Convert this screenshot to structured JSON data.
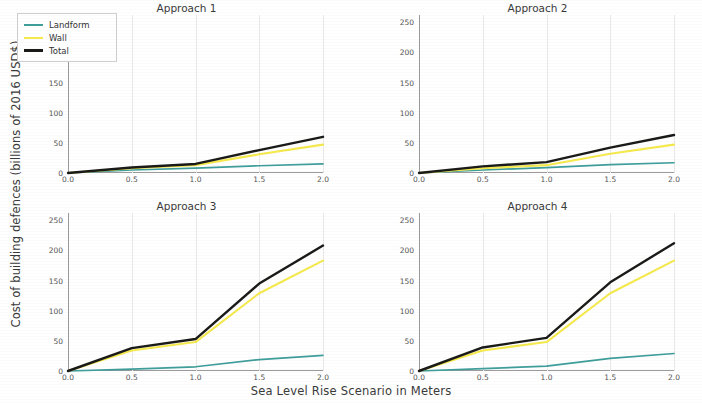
{
  "figure": {
    "ylabel": "Cost of building defences (billions of 2016 USD$)",
    "xlabel": "Sea Level Rise Scenario in Meters"
  },
  "legend": {
    "position": "upper-left-of-panel-1",
    "items": [
      {
        "label": "Landform",
        "color": "#3f9e9b",
        "width": 2.0
      },
      {
        "label": "Wall",
        "color": "#f5e94e",
        "width": 2.6
      },
      {
        "label": "Total",
        "color": "#1a1a18",
        "width": 3.0
      }
    ]
  },
  "axes": {
    "yticks": [
      "0",
      "50",
      "100",
      "150",
      "200",
      "250"
    ],
    "yvalues": [
      0,
      50,
      100,
      150,
      200,
      250
    ],
    "xticks": [
      "0.0",
      "0.5",
      "1.0",
      "1.5",
      "2.0"
    ],
    "xvalues": [
      0.0,
      0.5,
      1.0,
      1.5,
      2.0
    ],
    "ylim": [
      0,
      262
    ],
    "xlim": [
      0.0,
      2.0
    ],
    "grid": "vertical-only"
  },
  "chart_data": [
    {
      "type": "line",
      "title": "Approach 1",
      "xlabel": "Sea Level Rise Scenario in Meters",
      "ylabel": "Cost of building defences (billions of 2016 USD$)",
      "x": [
        0.0,
        0.5,
        1.0,
        1.5,
        2.0
      ],
      "xlim": [
        0.0,
        2.0
      ],
      "ylim": [
        0,
        262
      ],
      "grid": true,
      "legend": "upper left",
      "series": [
        {
          "name": "Landform",
          "color": "#3f9e9b",
          "values": [
            0,
            5,
            8,
            12,
            15
          ]
        },
        {
          "name": "Wall",
          "color": "#f5e94e",
          "values": [
            0,
            8,
            13,
            31,
            47
          ]
        },
        {
          "name": "Total",
          "color": "#1a1a18",
          "values": [
            0,
            9,
            15,
            38,
            60
          ]
        }
      ]
    },
    {
      "type": "line",
      "title": "Approach 2",
      "xlabel": "Sea Level Rise Scenario in Meters",
      "ylabel": "Cost of building defences (billions of 2016 USD$)",
      "x": [
        0.0,
        0.5,
        1.0,
        1.5,
        2.0
      ],
      "xlim": [
        0.0,
        2.0
      ],
      "ylim": [
        0,
        262
      ],
      "grid": true,
      "legend": "none",
      "series": [
        {
          "name": "Landform",
          "color": "#3f9e9b",
          "values": [
            0,
            5,
            9,
            14,
            17
          ]
        },
        {
          "name": "Wall",
          "color": "#f5e94e",
          "values": [
            0,
            8,
            13,
            32,
            47
          ]
        },
        {
          "name": "Total",
          "color": "#1a1a18",
          "values": [
            0,
            11,
            18,
            42,
            63
          ]
        }
      ]
    },
    {
      "type": "line",
      "title": "Approach 3",
      "xlabel": "Sea Level Rise Scenario in Meters",
      "ylabel": "Cost of building defences (billions of 2016 USD$)",
      "x": [
        0.0,
        0.5,
        1.0,
        1.5,
        2.0
      ],
      "xlim": [
        0.0,
        2.0
      ],
      "ylim": [
        0,
        262
      ],
      "grid": true,
      "legend": "none",
      "series": [
        {
          "name": "Landform",
          "color": "#3f9e9b",
          "values": [
            0,
            3,
            7,
            19,
            26
          ]
        },
        {
          "name": "Wall",
          "color": "#f5e94e",
          "values": [
            0,
            34,
            48,
            129,
            183
          ]
        },
        {
          "name": "Total",
          "color": "#1a1a18",
          "values": [
            0,
            38,
            53,
            145,
            208
          ]
        }
      ]
    },
    {
      "type": "line",
      "title": "Approach 4",
      "xlabel": "Sea Level Rise Scenario in Meters",
      "ylabel": "Cost of building defences (billions of 2016 USD$)",
      "x": [
        0.0,
        0.5,
        1.0,
        1.5,
        2.0
      ],
      "xlim": [
        0.0,
        2.0
      ],
      "ylim": [
        0,
        262
      ],
      "grid": true,
      "legend": "none",
      "series": [
        {
          "name": "Landform",
          "color": "#3f9e9b",
          "values": [
            0,
            4,
            8,
            21,
            29
          ]
        },
        {
          "name": "Wall",
          "color": "#f5e94e",
          "values": [
            0,
            34,
            48,
            129,
            183
          ]
        },
        {
          "name": "Total",
          "color": "#1a1a18",
          "values": [
            0,
            39,
            55,
            147,
            212
          ]
        }
      ]
    }
  ]
}
